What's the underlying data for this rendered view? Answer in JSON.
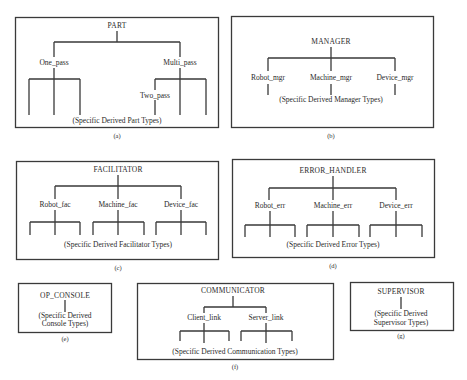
{
  "diagrams": {
    "a": {
      "root": "PART",
      "children": [
        "One_pass",
        "Multi_pass"
      ],
      "grandchild": "Two_pass",
      "leaf_note": "(Specific Derived Part Types)",
      "caption": "(a)"
    },
    "b": {
      "root": "MANAGER",
      "children": [
        "Robot_mgr",
        "Machine_mgr",
        "Device_mgr"
      ],
      "leaf_note": "(Specific Derived Manager Types)",
      "caption": "(b)"
    },
    "c": {
      "root": "FACILITATOR",
      "children": [
        "Robot_fac",
        "Machine_fac",
        "Device_fac"
      ],
      "leaf_note": "(Specific Derived Facilitator Types)",
      "caption": "(c)"
    },
    "d": {
      "root": "ERROR_HANDLER",
      "children": [
        "Robot_err",
        "Machine_err",
        "Device_err"
      ],
      "leaf_note": "(Specific Derived Error Types)",
      "caption": "(d)"
    },
    "e": {
      "root": "OP_CONSOLE",
      "leaf_note_line1": "(Specific Derived",
      "leaf_note_line2": "Console Types)",
      "caption": "(e)"
    },
    "f": {
      "root": "COMMUNICATOR",
      "children": [
        "Client_link",
        "Server_link"
      ],
      "leaf_note": "(Specific Derived Communication Types)",
      "caption": "(f)"
    },
    "g": {
      "root": "SUPERVISOR",
      "leaf_note_line1": "(Specific Derived",
      "leaf_note_line2": "Supervisor Types)",
      "caption": "(g)"
    }
  }
}
